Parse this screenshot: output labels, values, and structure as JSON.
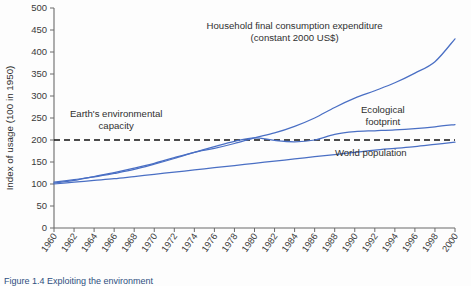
{
  "chart_data": {
    "type": "line",
    "title": "",
    "xlabel": "",
    "ylabel": "Index of usage (100 in 1950)",
    "ylim": [
      0,
      500
    ],
    "ytick_values": [
      0,
      50,
      100,
      150,
      200,
      250,
      300,
      350,
      400,
      450,
      500
    ],
    "ytick_labels": [
      "0",
      "50",
      "100",
      "150",
      "200",
      "250",
      "300",
      "350",
      "400",
      "450",
      "500"
    ],
    "xlim": [
      1960,
      2000
    ],
    "x": [
      1960,
      1962,
      1964,
      1966,
      1968,
      1970,
      1972,
      1974,
      1976,
      1978,
      1980,
      1982,
      1984,
      1986,
      1988,
      1990,
      1992,
      1994,
      1996,
      1998,
      2000
    ],
    "xtick_labels": [
      "1960",
      "1962",
      "1964",
      "1966",
      "1968",
      "1970",
      "1972",
      "1974",
      "1976",
      "1978",
      "1980",
      "1982",
      "1984",
      "1986",
      "1988",
      "1990",
      "1992",
      "1994",
      "1996",
      "1998",
      "2000"
    ],
    "grid": false,
    "legend_position": "inline-annotations",
    "series": [
      {
        "name": "Household final consumption expenditure (constant 2000 US$)",
        "color": "#4a6fc4",
        "values": [
          102,
          108,
          117,
          126,
          136,
          147,
          160,
          172,
          181,
          192,
          205,
          216,
          231,
          250,
          274,
          295,
          312,
          330,
          352,
          378,
          430
        ]
      },
      {
        "name": "Ecological footprint",
        "color": "#4a6fc4",
        "values": [
          104,
          110,
          116,
          124,
          133,
          145,
          158,
          172,
          185,
          197,
          205,
          199,
          196,
          200,
          213,
          219,
          221,
          223,
          226,
          230,
          235
        ]
      },
      {
        "name": "World population",
        "color": "#4a6fc4",
        "values": [
          100,
          104,
          108,
          112,
          117,
          122,
          127,
          132,
          137,
          142,
          147,
          152,
          157,
          162,
          167,
          172,
          177,
          181,
          185,
          190,
          195
        ]
      }
    ],
    "reference_line": {
      "name": "Earth's environmental capacity",
      "value": 200,
      "style": "dashed",
      "color": "#111111"
    },
    "annotations": [
      {
        "name": "earth-capacity-annotation",
        "lines": [
          "Earth's environmental",
          "capacity"
        ],
        "x": 1966.2,
        "y": 252
      },
      {
        "name": "household-expenditure-annotation",
        "lines": [
          "Household final consumption expenditure",
          "(constant 2000 US$)"
        ],
        "x": 1984.0,
        "y": 452
      },
      {
        "name": "ecological-footprint-annotation",
        "lines": [
          "Ecological",
          "footprint"
        ],
        "x": 1992.8,
        "y": 262
      },
      {
        "name": "world-population-annotation",
        "lines": [
          "World population"
        ],
        "x": 1991.6,
        "y": 163
      }
    ]
  },
  "caption": {
    "text": "Figure 1.4  Exploiting the environment"
  }
}
